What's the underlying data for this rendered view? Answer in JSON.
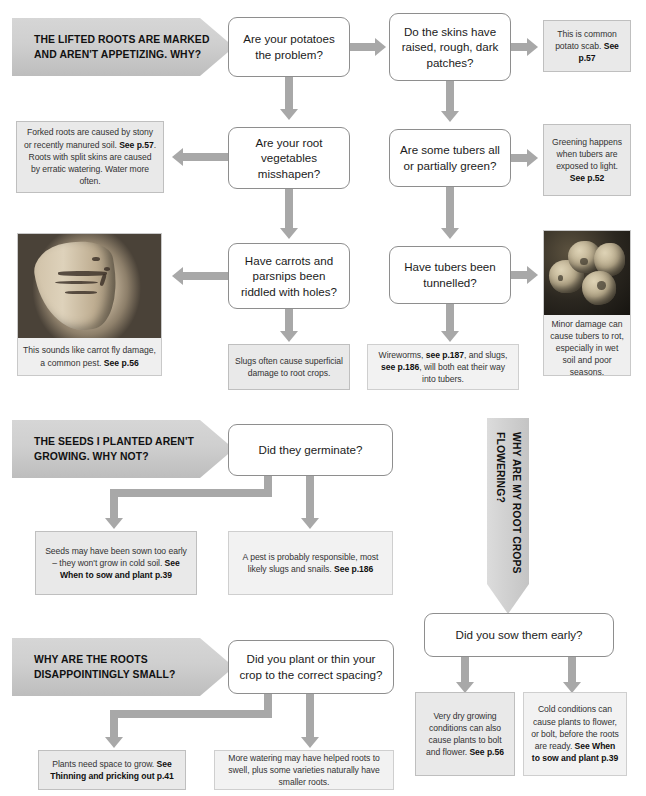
{
  "banners": {
    "lifted_roots": "THE LIFTED ROOTS ARE MARKED AND AREN'T APPETIZING. WHY?",
    "seeds_not_growing": "THE SEEDS I PLANTED AREN'T GROWING. WHY NOT?",
    "roots_small": "WHY ARE THE ROOTS DISAPPOINTINGLY SMALL?",
    "root_crops_flowering": "WHY ARE MY ROOT CROPS FLOWERING?"
  },
  "questions": {
    "potatoes_problem": "Are your potatoes the problem?",
    "skins_patches": "Do the skins have raised, rough, dark patches?",
    "veg_misshapen": "Are your root vegetables misshapen?",
    "tubers_green": "Are some tubers all or partially green?",
    "carrots_holes": "Have carrots and parsnips been riddled with holes?",
    "tubers_tunnelled": "Have tubers been tunnelled?",
    "did_germinate": "Did they germinate?",
    "plant_or_thin": "Did you plant or thin your crop to the correct spacing?",
    "sow_them_early": "Did you sow them early?"
  },
  "answers": {
    "potato_scab": {
      "text": "This is common potato scab. ",
      "ref": "See p.57"
    },
    "greening": {
      "text": "Greening happens when tubers are exposed to light. ",
      "ref": "See p.52"
    },
    "forked_roots": {
      "line1": "Forked roots are caused by stony or recently manured soil. ",
      "ref1": "See p.57",
      "line2": ". Roots with split skins are caused by erratic watering. Water more often."
    },
    "slugs_superficial": {
      "text": "Slugs often cause superficial damage to root crops.",
      "ref": ""
    },
    "wireworms": {
      "pre": "Wireworms, ",
      "ref1": "see p.187",
      "mid": ", and slugs, ",
      "ref2": "see p.186",
      "post": ", will both eat their way into tubers."
    },
    "seeds_sown_early": {
      "text": "Seeds may have been sown too early – they won't grow in cold soil. ",
      "ref": "See When to sow and plant p.39"
    },
    "pest_responsible": {
      "text": "A pest is probably responsible, most likely slugs and snails. ",
      "ref": "See p.186"
    },
    "plants_need_space": {
      "text": "Plants need space to grow. ",
      "ref": "See Thinning and pricking out p.41"
    },
    "more_watering": {
      "text": "More watering may have helped roots to swell, plus some varieties naturally have smaller roots.",
      "ref": ""
    },
    "very_dry": {
      "text": "Very dry growing conditions can also cause plants to bolt and flower. ",
      "ref": "See p.56"
    },
    "cold_conditions": {
      "text": "Cold conditions can cause plants to flower, or bolt, before the roots are ready. ",
      "ref": "See When to sow and plant p.39"
    }
  },
  "photos": {
    "carrot": {
      "caption": "This sounds like carrot fly damage, a common pest. ",
      "ref": "See p.56",
      "alt": "carrot-fly-damage-photo"
    },
    "tubers": {
      "caption": "Minor damage can cause tubers to rot, especially in wet soil and poor seasons.",
      "ref": "",
      "alt": "rotting-tubers-photo"
    }
  },
  "colors": {
    "banner_grey": "#cfcfcf",
    "answer_box_fill": "#e9e9e9",
    "arrow_grey": "#a8a8a8",
    "question_border": "#8e8e8e"
  }
}
